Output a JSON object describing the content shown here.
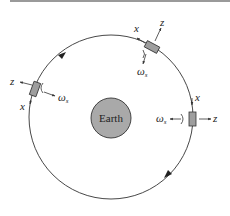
{
  "diagram": {
    "central_body": {
      "label": "Earth",
      "fill": "#a9a9a9"
    },
    "orbit": {
      "direction": "counterclockwise",
      "stroke": "#333333"
    },
    "satellites": [
      {
        "id": "top-right",
        "labels": {
          "x": "x",
          "z": "z",
          "omega": "ω",
          "omega_sub": "s"
        }
      },
      {
        "id": "left",
        "labels": {
          "x": "x",
          "z": "z",
          "omega": "ω",
          "omega_sub": "s"
        }
      },
      {
        "id": "right",
        "labels": {
          "x": "x",
          "z": "z",
          "omega": "ω",
          "omega_sub": "s"
        }
      }
    ],
    "colors": {
      "satellite_fill": "#9e9e9e",
      "line": "#333333",
      "topbar": "#9a9a9a"
    }
  }
}
